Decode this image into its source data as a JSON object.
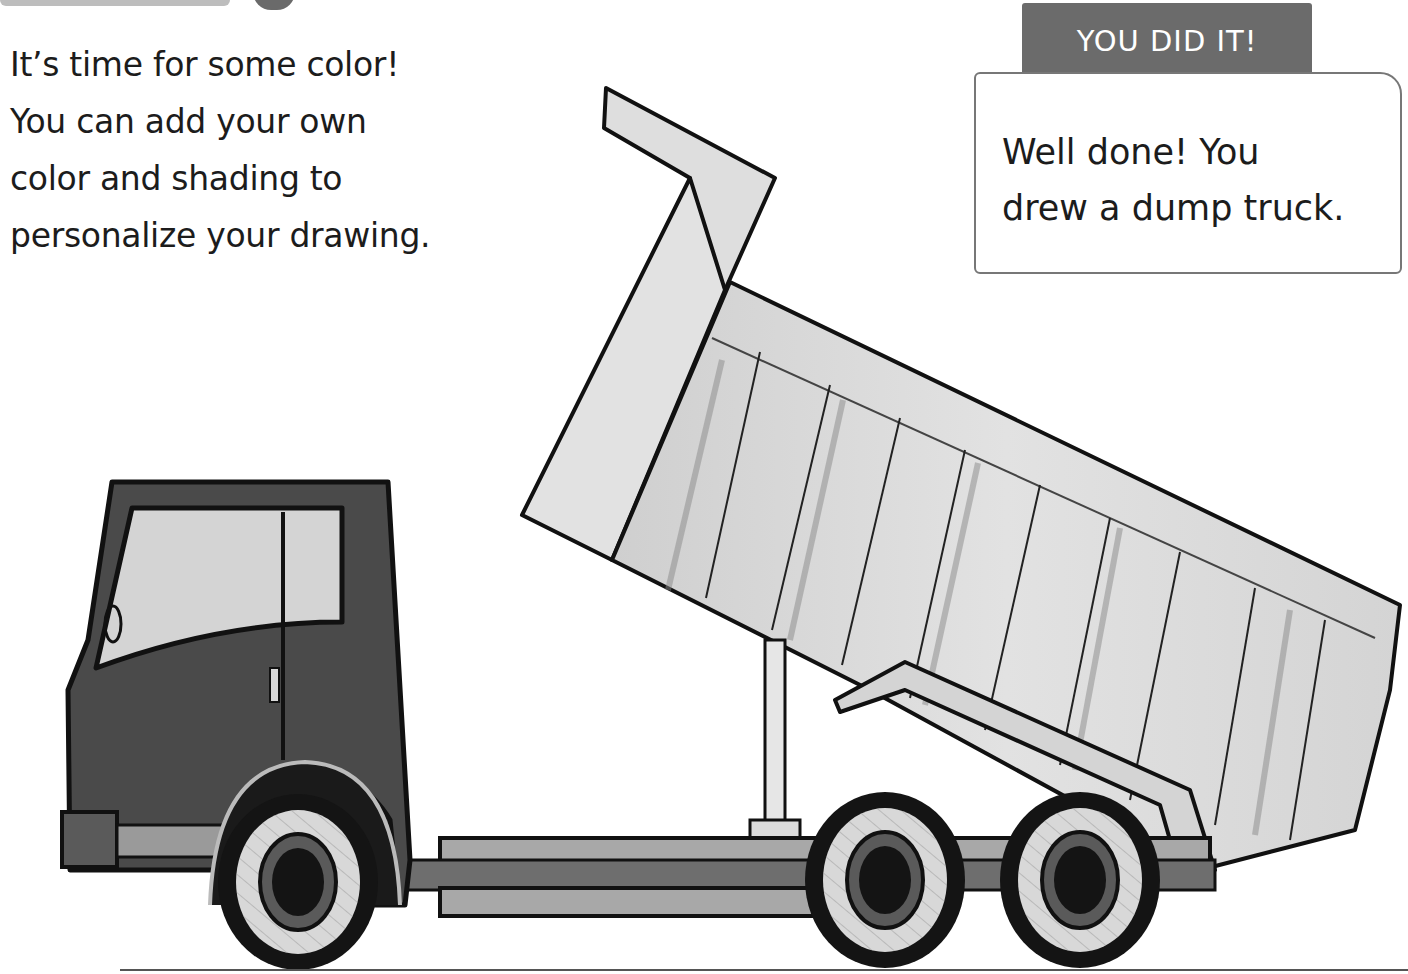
{
  "page": {
    "intro_lines": [
      "It’s time for some color!",
      "You can add your own",
      "color and shading to",
      "personalize your drawing."
    ],
    "badge": {
      "title": "YOU DID IT!",
      "message_lines": [
        "Well done! You",
        "drew a dump truck."
      ]
    },
    "illustration": {
      "subject": "dump-truck",
      "colors": {
        "cab": "#4a4a4a",
        "window": "#d6d6d6",
        "bed": "#dcdcdc",
        "outline": "#111111",
        "tire": "#141414",
        "hub": "#d8d8d8",
        "chassis": "#9a9a9a"
      }
    }
  }
}
